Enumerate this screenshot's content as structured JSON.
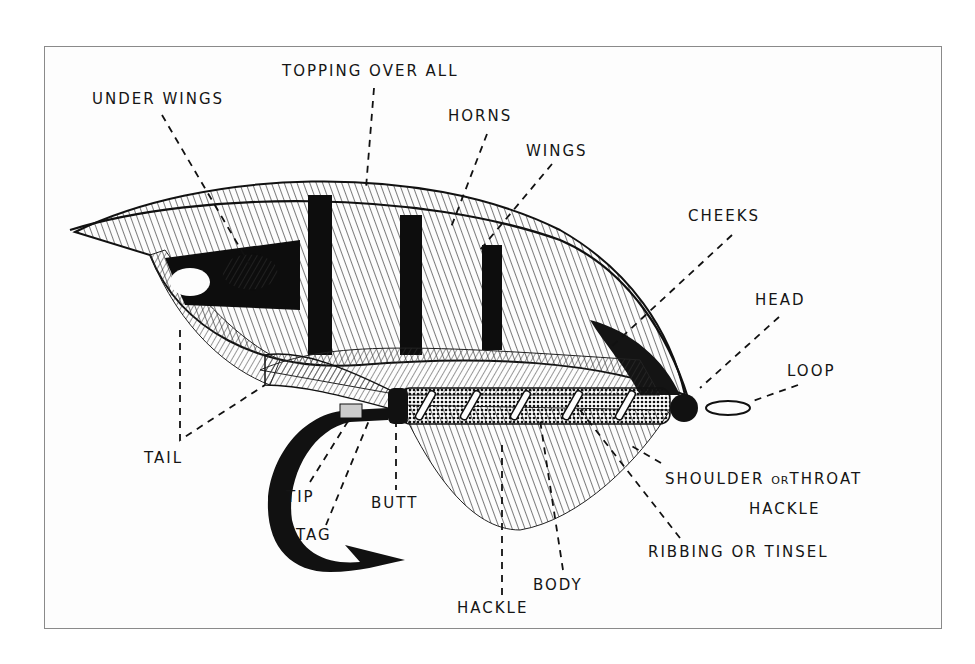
{
  "diagram": {
    "colors": {
      "ink": "#151515",
      "paper": "#fdfdfd",
      "frame": "#8a8a8a"
    },
    "labels": {
      "topping_over_all": "TOPPING OVER ALL",
      "under_wings": "UNDER WINGS",
      "horns": "HORNS",
      "wings": "WINGS",
      "cheeks": "CHEEKS",
      "head": "HEAD",
      "loop": "LOOP",
      "tail": "TAIL",
      "tip": "TIP",
      "tag": "TAG",
      "butt": "BUTT",
      "shoulder_a": "SHOULDER ",
      "shoulder_or": "OR",
      "shoulder_b": "THROAT",
      "shoulder_line2": "HACKLE",
      "ribbing_a": "RIBBING ",
      "ribbing_or": "OR",
      "ribbing_b": " TINSEL",
      "body": "BODY",
      "hackle": "HACKLE"
    }
  }
}
